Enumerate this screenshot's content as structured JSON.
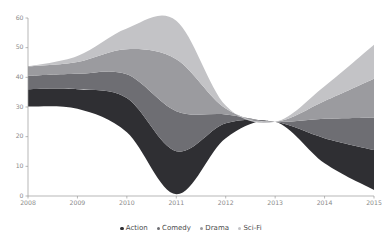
{
  "chart_data": {
    "type": "area",
    "variant": "stacked-area-streamgraph",
    "title": "",
    "xlabel": "",
    "ylabel": "",
    "x": [
      2008,
      2009,
      2010,
      2011,
      2012,
      2013,
      2014,
      2015
    ],
    "categories": [
      "2008",
      "2009",
      "2010",
      "2011",
      "2012",
      "2013",
      "2014",
      "2015"
    ],
    "xlim": [
      2008,
      2015
    ],
    "ylim": [
      0,
      60
    ],
    "yticks": [
      0,
      10,
      20,
      30,
      40,
      50,
      60
    ],
    "xticks": [
      "2008",
      "2009",
      "2010",
      "2011",
      "2012",
      "2013",
      "2014",
      "2015"
    ],
    "grid": false,
    "legend_position": "bottom-center",
    "baseline": [
      30.2,
      29.4,
      21.5,
      0.6,
      19.5,
      25.0,
      11.0,
      2.0
    ],
    "series": [
      {
        "name": "Action",
        "color": "#2f2f33",
        "values": [
          5.8,
          6.6,
          11.5,
          14.5,
          5.0,
          0.0,
          8.5,
          13.5
        ]
      },
      {
        "name": "Comedy",
        "color": "#6e6e73",
        "values": [
          4.5,
          5.2,
          8.0,
          13.5,
          3.0,
          0.0,
          6.5,
          11.0
        ]
      },
      {
        "name": "Drama",
        "color": "#9b9b9f",
        "values": [
          3.2,
          4.0,
          8.5,
          17.5,
          2.0,
          0.0,
          6.0,
          13.0
        ]
      },
      {
        "name": "Sci-Fi",
        "color": "#c3c3c6",
        "values": [
          0.0,
          2.0,
          7.0,
          13.0,
          1.0,
          0.0,
          5.0,
          11.5
        ]
      }
    ]
  },
  "legend": {
    "items": [
      {
        "label": "Action",
        "color": "#2f2f33"
      },
      {
        "label": "Comedy",
        "color": "#6e6e73"
      },
      {
        "label": "Drama",
        "color": "#9b9b9f"
      },
      {
        "label": "Sci-Fi",
        "color": "#c3c3c6"
      }
    ]
  },
  "axes": {
    "y_tick_labels": [
      "60",
      "50",
      "40",
      "30",
      "20",
      "10",
      "0"
    ],
    "x_tick_labels": [
      "2008",
      "2009",
      "2010",
      "2011",
      "2012",
      "2013",
      "2014",
      "2015"
    ]
  }
}
